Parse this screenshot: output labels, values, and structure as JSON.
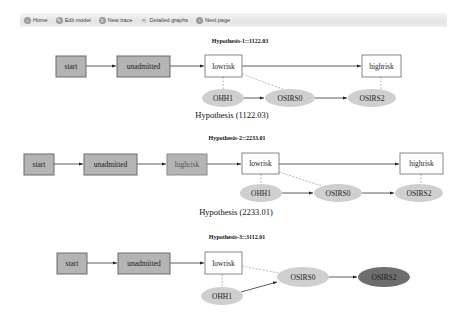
{
  "toolbar": {
    "items": [
      {
        "label": "Home",
        "icon": "home-icon",
        "glyph": "⌂"
      },
      {
        "label": "Edit model",
        "icon": "edit-icon",
        "glyph": "✎"
      },
      {
        "label": "New trace",
        "icon": "new-trace-icon",
        "glyph": "≡"
      },
      {
        "label": "Detailed graphs",
        "icon": "graphs-icon",
        "glyph": "✳"
      },
      {
        "label": "Next page",
        "icon": "next-page-icon",
        "glyph": "›"
      }
    ]
  },
  "colors": {
    "state_fill": "#b4b4b4",
    "state_border": "#6a6a6a",
    "current_fill": "#ffffff",
    "obs_fill": "#cfcfcf",
    "obs_highlight_fill": "#6e6e6e",
    "edge": "#333333",
    "dashed_edge": "#999999"
  },
  "hypotheses": [
    {
      "title": "Hypothesis-1::1122.03",
      "caption": "Hypothesis (1122.03)",
      "states": [
        "start",
        "unadmitted",
        "lowrisk",
        "highrisk"
      ],
      "observations": [
        "OHH1",
        "OSIRS0",
        "OSIRS2"
      ]
    },
    {
      "title": "Hypothesis-2::2233.01",
      "caption": "Hypothesis (2233.01)",
      "states": [
        "start",
        "unadmitted",
        "highrisk",
        "lowrisk",
        "highrisk"
      ],
      "observations": [
        "OHH1",
        "OSIRS0",
        "OSIRS2"
      ]
    },
    {
      "title": "Hypothesis-3::3112.01",
      "caption": "",
      "states": [
        "start",
        "unadmitted",
        "lowrisk"
      ],
      "observations": [
        "OHH1",
        "OSIRS0",
        "OSIRS2"
      ]
    }
  ]
}
